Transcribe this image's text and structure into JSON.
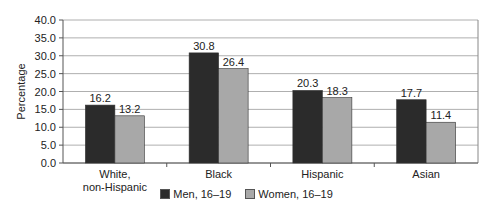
{
  "chart_data": {
    "type": "bar",
    "title": "",
    "xlabel": "",
    "ylabel": "Percentage",
    "ylim": [
      0,
      40
    ],
    "yticks": [
      "0.0",
      "5.0",
      "10.0",
      "15.0",
      "20.0",
      "25.0",
      "30.0",
      "35.0",
      "40.0"
    ],
    "grid": true,
    "legend_position": "bottom",
    "categories": [
      "White, non-Hispanic",
      "Black",
      "Hispanic",
      "Asian"
    ],
    "category_lines": [
      [
        "White,",
        "non-Hispanic"
      ],
      [
        "Black"
      ],
      [
        "Hispanic"
      ],
      [
        "Asian"
      ]
    ],
    "series": [
      {
        "name": "Men, 16–19",
        "color": "#2b2b2b",
        "values": [
          16.2,
          30.8,
          20.3,
          17.7
        ]
      },
      {
        "name": "Women, 16–19",
        "color": "#a8a8a8",
        "values": [
          13.2,
          26.4,
          18.3,
          11.4
        ]
      }
    ]
  }
}
